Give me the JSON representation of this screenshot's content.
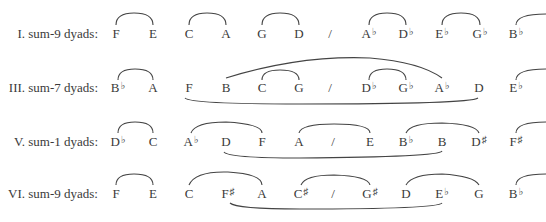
{
  "rows": [
    {
      "label": "I. sum-9 dyads:",
      "notes": [
        {
          "x": 116,
          "name": "F"
        },
        {
          "x": 153,
          "name": "E"
        },
        {
          "x": 189,
          "name": "C"
        },
        {
          "x": 226,
          "name": "A"
        },
        {
          "x": 262,
          "name": "G"
        },
        {
          "x": 299,
          "name": "D"
        },
        {
          "x": 330,
          "name": "/"
        },
        {
          "x": 369,
          "name": "A",
          "acc": "♭"
        },
        {
          "x": 406,
          "name": "D",
          "acc": "♭"
        },
        {
          "x": 442,
          "name": "E",
          "acc": "♭"
        },
        {
          "x": 480,
          "name": "G",
          "acc": "♭"
        },
        {
          "x": 516,
          "name": "B",
          "acc": "♭"
        }
      ]
    },
    {
      "label": "III. sum-7 dyads:",
      "notes": [
        {
          "x": 118,
          "name": "B",
          "acc": "♭"
        },
        {
          "x": 153,
          "name": "A"
        },
        {
          "x": 189,
          "name": "F"
        },
        {
          "x": 226,
          "name": "B"
        },
        {
          "x": 262,
          "name": "C"
        },
        {
          "x": 299,
          "name": "G"
        },
        {
          "x": 330,
          "name": "/"
        },
        {
          "x": 369,
          "name": "D",
          "acc": "♭"
        },
        {
          "x": 406,
          "name": "G",
          "acc": "♭"
        },
        {
          "x": 442,
          "name": "A",
          "acc": "♭"
        },
        {
          "x": 479,
          "name": "D"
        },
        {
          "x": 516,
          "name": "E",
          "acc": "♭"
        }
      ]
    },
    {
      "label": "V. sum-1 dyads:",
      "notes": [
        {
          "x": 118,
          "name": "D",
          "acc": "♭"
        },
        {
          "x": 153,
          "name": "C"
        },
        {
          "x": 191,
          "name": "A",
          "acc": "♭"
        },
        {
          "x": 226,
          "name": "D"
        },
        {
          "x": 262,
          "name": "F"
        },
        {
          "x": 299,
          "name": "A"
        },
        {
          "x": 333,
          "name": "/"
        },
        {
          "x": 370,
          "name": "E"
        },
        {
          "x": 406,
          "name": "B",
          "acc": "♭"
        },
        {
          "x": 442,
          "name": "B"
        },
        {
          "x": 479,
          "name": "D",
          "acc": "♯"
        },
        {
          "x": 516,
          "name": "F",
          "acc": "♯"
        }
      ]
    },
    {
      "label": "VI. sum-9 dyads:",
      "notes": [
        {
          "x": 116,
          "name": "F"
        },
        {
          "x": 153,
          "name": "E"
        },
        {
          "x": 189,
          "name": "C"
        },
        {
          "x": 228,
          "name": "F",
          "acc": "♯"
        },
        {
          "x": 262,
          "name": "A"
        },
        {
          "x": 301,
          "name": "C",
          "acc": "♯"
        },
        {
          "x": 333,
          "name": "/"
        },
        {
          "x": 370,
          "name": "G",
          "acc": "♯"
        },
        {
          "x": 406,
          "name": "D"
        },
        {
          "x": 442,
          "name": "E",
          "acc": "♭"
        },
        {
          "x": 479,
          "name": "G"
        },
        {
          "x": 516,
          "name": "B",
          "acc": "♭"
        }
      ]
    }
  ]
}
